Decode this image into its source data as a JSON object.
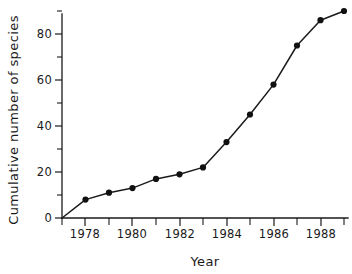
{
  "chart_data": {
    "type": "line",
    "title": "",
    "xlabel": "Year",
    "ylabel": "Cumulative number of species",
    "x": [
      1977,
      1978,
      1979,
      1980,
      1981,
      1982,
      1983,
      1984,
      1985,
      1986,
      1987,
      1988,
      1989
    ],
    "values": [
      0,
      8,
      11,
      13,
      17,
      19,
      22,
      33,
      45,
      58,
      75,
      86,
      90
    ],
    "series": [
      {
        "name": "Cumulative number of species",
        "values": [
          0,
          8,
          11,
          13,
          17,
          19,
          22,
          33,
          45,
          58,
          75,
          86,
          90
        ]
      }
    ],
    "xlim": [
      1977,
      1989
    ],
    "ylim": [
      0,
      92
    ],
    "x_tick_values": [
      1977,
      1978,
      1979,
      1980,
      1981,
      1982,
      1983,
      1984,
      1985,
      1986,
      1987,
      1988,
      1989
    ],
    "x_tick_labels": [
      "",
      "1978",
      "",
      "1980",
      "",
      "1982",
      "",
      "1984",
      "",
      "1986",
      "",
      "1988",
      ""
    ],
    "y_tick_values": [
      0,
      10,
      20,
      30,
      40,
      50,
      60,
      70,
      80,
      90
    ],
    "y_tick_labels": [
      "0",
      "",
      "20",
      "",
      "40",
      "",
      "60",
      "",
      "80",
      ""
    ],
    "grid": false,
    "legend": "none",
    "marker": "filled-circle",
    "line_color": "#1a1a1a",
    "marker_color": "#111111",
    "background_color": "#ffffff"
  }
}
